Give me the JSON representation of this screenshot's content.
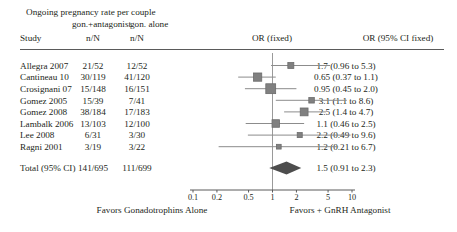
{
  "chart_data": {
    "type": "forest",
    "title": "Ongoing pregnancy rate per couple",
    "group_headers": {
      "treatment": "gon.+antagonist",
      "control": "gon. alone"
    },
    "columns": {
      "study": "Study",
      "treatment_nN": "n/N",
      "control_nN": "n/N",
      "plot": "OR (fixed)",
      "effect": "OR (95% CI fixed)"
    },
    "effect_measure": "OR (fixed)",
    "axis": {
      "scale": "log",
      "ticks": [
        "0.1",
        "0.2",
        "0.5",
        "1",
        "2",
        "5",
        "10"
      ],
      "tick_values": [
        0.1,
        0.2,
        0.5,
        1,
        2,
        5,
        10
      ],
      "xlim": [
        0.1,
        10
      ],
      "null_value": 1,
      "left_label": "Favors Gonadotrophins Alone",
      "right_label": "Favors + GnRH Antagonist"
    },
    "rows": [
      {
        "study": "Allegra 2007",
        "tn": "21/52",
        "cn": "12/52",
        "or": 1.7,
        "lo": 0.96,
        "hi": 5.3,
        "text": "1.7 (0.96 to 5.3)",
        "weight": 0.4
      },
      {
        "study": "Cantineau 10",
        "tn": "30/119",
        "cn": "41/120",
        "or": 0.65,
        "lo": 0.37,
        "hi": 1.1,
        "text": "0.65 (0.37 to 1.1)",
        "weight": 0.72
      },
      {
        "study": "Crosignani 07",
        "tn": "15/148",
        "cn": "16/151",
        "or": 0.95,
        "lo": 0.45,
        "hi": 2.0,
        "text": "0.95 (0.45 to 2.0)",
        "weight": 0.95
      },
      {
        "study": "Gomez 2005",
        "tn": "15/39",
        "cn": "7/41",
        "or": 3.1,
        "lo": 1.1,
        "hi": 8.6,
        "text": "3.1 (1.1 to 8.6)",
        "weight": 0.33
      },
      {
        "study": "Gomez 2008",
        "tn": "38/184",
        "cn": "17/183",
        "or": 2.5,
        "lo": 1.4,
        "hi": 4.7,
        "text": "2.5 (1.4 to 4.7)",
        "weight": 0.66
      },
      {
        "study": "Lambalk 2006",
        "tn": "13/103",
        "cn": "12/100",
        "or": 1.1,
        "lo": 0.46,
        "hi": 2.5,
        "text": "1.1 (0.46 to 2.5)",
        "weight": 0.62
      },
      {
        "study": "Lee 2008",
        "tn": "6/31",
        "cn": "3/30",
        "or": 2.2,
        "lo": 0.49,
        "hi": 9.6,
        "text": "2.2 (0.49 to 9.6)",
        "weight": 0.26
      },
      {
        "study": "Ragni 2001",
        "tn": "3/19",
        "cn": "3/22",
        "or": 1.2,
        "lo": 0.21,
        "hi": 6.7,
        "text": "1.2 (0.21 to 6.7)",
        "weight": 0.22
      }
    ],
    "total": {
      "study": "Total (95% CI)",
      "tn": "141/695",
      "cn": "111/699",
      "or": 1.5,
      "lo": 0.91,
      "hi": 2.3,
      "text": "1.5 (0.91 to 2.3)"
    },
    "colors": {
      "marker": "#808080",
      "marker_edge": "#6b6b6b",
      "ci_line": "#8c8c8c",
      "null_line": "#9a9a9a",
      "diamond": "#4d4d4d",
      "rule": "#5a5a5a",
      "text": "#231f20"
    }
  }
}
